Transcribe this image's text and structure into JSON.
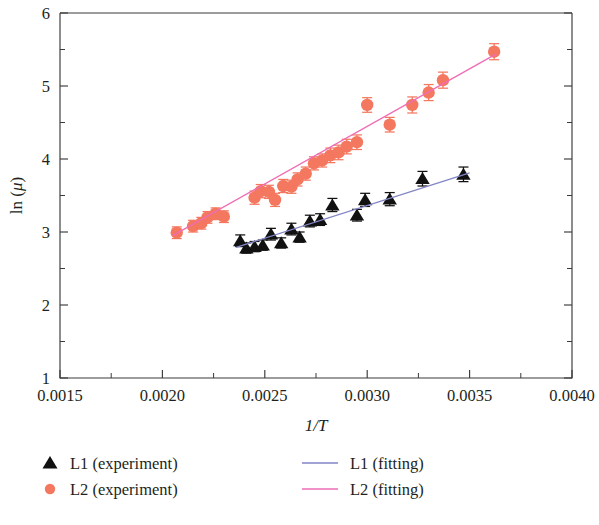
{
  "chart_data": {
    "type": "scatter",
    "title": "",
    "xlabel": "1/T",
    "ylabel": "ln (μ)",
    "xlim": [
      0.0015,
      0.004
    ],
    "ylim": [
      1,
      6
    ],
    "xticks": [
      "0.0015",
      "0.0020",
      "0.0025",
      "0.0030",
      "0.0035",
      "0.0040"
    ],
    "xtick_values": [
      0.0015,
      0.002,
      0.0025,
      0.003,
      0.0035,
      0.004
    ],
    "yticks": [
      "1",
      "2",
      "3",
      "4",
      "5",
      "6"
    ],
    "ytick_values": [
      1,
      2,
      3,
      4,
      5,
      6
    ],
    "x_minor_step": 0.00025,
    "y_minor_step": 0.5,
    "grid": false,
    "legend_position": "below-plot",
    "series": [
      {
        "name": "L1 (experiment)",
        "kind": "scatter",
        "marker": "triangle",
        "color": "#111111",
        "error_bars": true,
        "x": [
          0.00238,
          0.00241,
          0.00245,
          0.00249,
          0.00253,
          0.00258,
          0.00263,
          0.00267,
          0.00272,
          0.00277,
          0.00283,
          0.00295,
          0.00299,
          0.00311,
          0.00327,
          0.00347
        ],
        "y": [
          2.88,
          2.78,
          2.8,
          2.82,
          2.97,
          2.85,
          3.04,
          2.93,
          3.15,
          3.17,
          3.37,
          3.23,
          3.44,
          3.45,
          3.73,
          3.79
        ],
        "yerr": [
          0.08,
          0.07,
          0.07,
          0.07,
          0.08,
          0.07,
          0.08,
          0.07,
          0.08,
          0.08,
          0.09,
          0.08,
          0.09,
          0.09,
          0.1,
          0.1
        ]
      },
      {
        "name": "L2 (experiment)",
        "kind": "scatter",
        "marker": "circle",
        "color": "#F4775F",
        "error_bars": true,
        "x": [
          0.00207,
          0.00215,
          0.00219,
          0.00222,
          0.00226,
          0.0023,
          0.00245,
          0.00248,
          0.00252,
          0.00255,
          0.00259,
          0.00263,
          0.00266,
          0.0027,
          0.00274,
          0.00278,
          0.00282,
          0.00286,
          0.0029,
          0.00295,
          0.003,
          0.00311,
          0.00322,
          0.0033,
          0.00337,
          0.00362
        ],
        "y": [
          2.99,
          3.08,
          3.12,
          3.2,
          3.25,
          3.21,
          3.47,
          3.56,
          3.55,
          3.44,
          3.63,
          3.62,
          3.72,
          3.8,
          3.94,
          3.98,
          4.05,
          4.09,
          4.17,
          4.23,
          4.74,
          4.47,
          4.74,
          4.91,
          5.08,
          5.47
        ],
        "yerr": [
          0.08,
          0.08,
          0.08,
          0.08,
          0.08,
          0.08,
          0.09,
          0.09,
          0.09,
          0.09,
          0.09,
          0.09,
          0.09,
          0.09,
          0.09,
          0.09,
          0.1,
          0.1,
          0.1,
          0.1,
          0.1,
          0.1,
          0.11,
          0.11,
          0.11,
          0.11
        ]
      },
      {
        "name": "L1 (fitting)",
        "kind": "line",
        "color": "#8285C6",
        "x": [
          0.00236,
          0.0035
        ],
        "y": [
          2.79,
          3.81
        ]
      },
      {
        "name": "L2 (fitting)",
        "kind": "line",
        "color": "#EE6DB5",
        "x": [
          0.00205,
          0.00363
        ],
        "y": [
          2.95,
          5.44
        ]
      }
    ]
  },
  "legend": {
    "entries": [
      {
        "label": "L1 (experiment)",
        "symbol": "triangle",
        "color": "#111111"
      },
      {
        "label": "L2 (experiment)",
        "symbol": "circle",
        "color": "#F4775F"
      },
      {
        "label": "L1 (fitting)",
        "symbol": "line",
        "color": "#8285C6"
      },
      {
        "label": "L2 (fitting)",
        "symbol": "line",
        "color": "#EE6DB5"
      }
    ]
  },
  "axes": {
    "x_title": "1/T",
    "y_title_prefix": "ln (",
    "y_title_symbol": "μ",
    "y_title_suffix": ")"
  }
}
